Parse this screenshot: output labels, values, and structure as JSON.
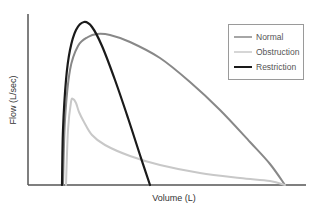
{
  "chart_data": {
    "type": "line",
    "title": "",
    "xlabel": "Volume (L)",
    "ylabel": "Flow (L/sec)",
    "grid": false,
    "legend_position": "upper right",
    "ticks": {
      "x": [],
      "y": []
    },
    "series": [
      {
        "name": "Normal",
        "color": "#888888",
        "stroke_width": 2,
        "description": "Rapid rise to broad peak, then nearly linear decline to baseline at large volume",
        "points": [
          [
            63,
            185
          ],
          [
            65,
            120
          ],
          [
            70,
            70
          ],
          [
            78,
            46
          ],
          [
            88,
            37
          ],
          [
            97,
            34
          ],
          [
            110,
            35
          ],
          [
            130,
            42
          ],
          [
            160,
            58
          ],
          [
            190,
            82
          ],
          [
            220,
            110
          ],
          [
            250,
            142
          ],
          [
            270,
            164
          ],
          [
            285,
            185
          ]
        ]
      },
      {
        "name": "Obstruction",
        "color": "#c8c8c8",
        "stroke_width": 2,
        "description": "Low sharp peak followed by concave (scooped) decay toward baseline",
        "points": [
          [
            66,
            185
          ],
          [
            68,
            130
          ],
          [
            71,
            102
          ],
          [
            73,
            99
          ],
          [
            76,
            103
          ],
          [
            79,
            112
          ],
          [
            84,
            122
          ],
          [
            92,
            135
          ],
          [
            105,
            145
          ],
          [
            130,
            156
          ],
          [
            160,
            165
          ],
          [
            200,
            173
          ],
          [
            240,
            178
          ],
          [
            270,
            181
          ],
          [
            285,
            185
          ]
        ]
      },
      {
        "name": "Restriction",
        "color": "#1a1a1a",
        "stroke_width": 2.2,
        "description": "Tall narrow peak with small total volume",
        "points": [
          [
            62,
            185
          ],
          [
            63,
            130
          ],
          [
            66,
            80
          ],
          [
            70,
            50
          ],
          [
            76,
            30
          ],
          [
            84,
            22
          ],
          [
            92,
            27
          ],
          [
            102,
            46
          ],
          [
            115,
            80
          ],
          [
            128,
            118
          ],
          [
            140,
            155
          ],
          [
            150,
            185
          ]
        ]
      }
    ],
    "axes": {
      "origin": [
        28,
        185
      ],
      "y_top": 14,
      "x_right": 306
    }
  },
  "legend": {
    "items": [
      {
        "label": "Normal",
        "color": "#888888"
      },
      {
        "label": "Obstruction",
        "color": "#c8c8c8"
      },
      {
        "label": "Restriction",
        "color": "#1a1a1a"
      }
    ]
  },
  "labels": {
    "x_axis": "Volume (L)",
    "y_axis": "Flow (L/sec)"
  }
}
